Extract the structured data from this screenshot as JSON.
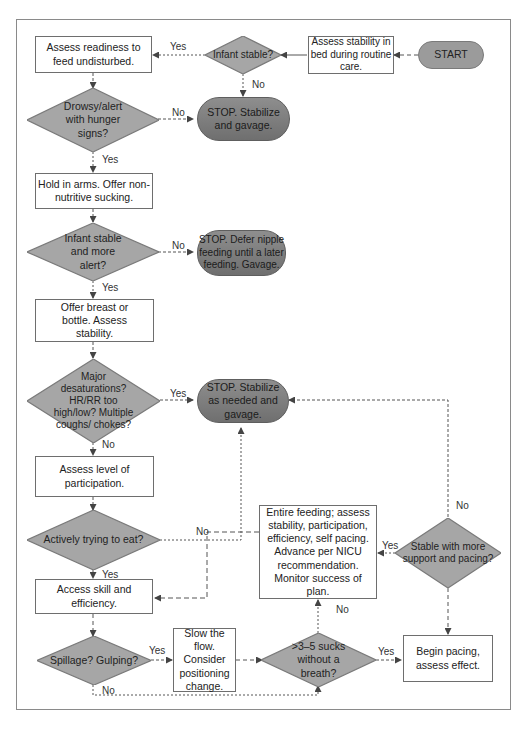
{
  "colors": {
    "terminal_start": "#9b9b9b",
    "terminal_stop": "#7a7a7a",
    "decision": "#a6a6a6",
    "process_fill": "#ffffff",
    "line": "#555555"
  },
  "nodes": {
    "start": "START",
    "assess_stability_bed": "Assess stability in bed during routine care.",
    "infant_stable": "Infant stable?",
    "assess_readiness": "Assess readiness to feed undisturbed.",
    "stop_stabilize_gavage": "STOP. Stabilize and gavage.",
    "drowsy_alert": "Drowsy/alert with hunger signs?",
    "hold_in_arms": "Hold in arms. Offer non-nutritive sucking.",
    "infant_stable_alert": "Infant stable and more alert?",
    "stop_defer": "STOP. Defer nipple feeding until a later feeding. Gavage.",
    "offer_breast": "Offer breast or bottle. Assess stability.",
    "major_desat": "Major desaturations? HR/RR too high/low? Multiple coughs/ chokes?",
    "stop_stabilize_needed": "STOP. Stabilize as needed and gavage.",
    "assess_participation": "Assess level of participation.",
    "actively_trying": "Actively trying to eat?",
    "access_skill": "Access skill and efficiency.",
    "spillage": "Spillage? Gulping?",
    "slow_flow": "Slow the flow. Consider positioning change.",
    "sucks_without_breath": ">3–5 sucks without a breath?",
    "begin_pacing": "Begin pacing, assess effect.",
    "stable_more_support": "Stable with more support and pacing?",
    "entire_feeding": "Entire feeding; assess stability, participation, efficiency, self pacing. Advance per NICU recommendation. Monitor success of plan."
  },
  "labels": {
    "yes": "Yes",
    "no": "No"
  }
}
